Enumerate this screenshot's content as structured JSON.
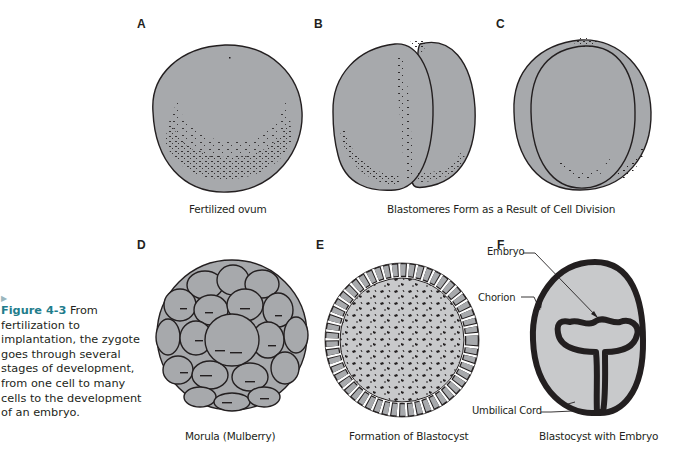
{
  "figure": {
    "number_label": "Figure 4-3",
    "caption_text": " From fertilization to implantation, the zygote goes through several stages of development, from one cell to many cells to the development of an embryo.",
    "marker_icon": "triangle-right-icon",
    "accent_color": "#1f7d8c",
    "fill_color": "#a7a9ac",
    "light_fill_color": "#c8c9cb",
    "outline_color": "#231f20"
  },
  "panels": {
    "A": {
      "letter": "A",
      "caption": "Fertilized ovum"
    },
    "B": {
      "letter": "B"
    },
    "C": {
      "letter": "C"
    },
    "BC_caption": "Blastomeres Form as a Result of Cell Division",
    "D": {
      "letter": "D",
      "caption": "Morula (Mulberry)"
    },
    "E": {
      "letter": "E",
      "caption": "Formation of Blastocyst"
    },
    "F": {
      "letter": "F",
      "caption": "Blastocyst with Embryo",
      "labels": {
        "embryo": "Embryo",
        "chorion": "Chorion",
        "umbilical_cord": "Umbilical Cord"
      }
    }
  }
}
